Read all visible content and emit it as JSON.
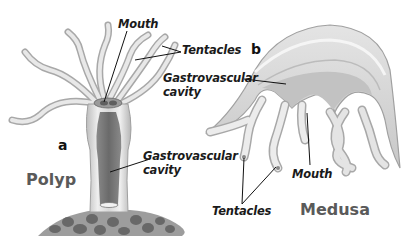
{
  "diagram": {
    "colors": {
      "body_light": "#e6e6e6",
      "body_mid": "#c4c4c4",
      "cavity_dark": "#7a7a7a",
      "outline": "#9a9a9a",
      "rock": "#6e6e6e",
      "label_text": "#1a1a1a",
      "title_text": "#5a5a5a"
    },
    "polyp": {
      "letter": "a",
      "title": "Polyp",
      "labels": {
        "mouth": "Mouth",
        "tentacles": "Tentacles",
        "cavity_line1": "Gastrovascular",
        "cavity_line2": "cavity"
      }
    },
    "medusa": {
      "letter": "b",
      "title": "Medusa",
      "labels": {
        "mouth": "Mouth",
        "tentacles": "Tentacles",
        "cavity_line1": "Gastrovascular",
        "cavity_line2": "cavity"
      }
    }
  }
}
